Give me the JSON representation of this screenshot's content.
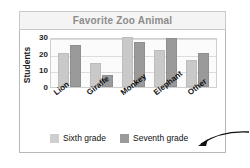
{
  "chart_data": {
    "type": "bar",
    "title": "Favorite Zoo Animal",
    "xlabel": "",
    "ylabel": "Students",
    "ylim": [
      0,
      30
    ],
    "yticks": [
      30,
      20,
      10,
      0
    ],
    "grid": true,
    "legend_position": "bottom",
    "categories": [
      "Lion",
      "Giraffe",
      "Monkey",
      "Elephant",
      "Other"
    ],
    "series": [
      {
        "name": "Sixth grade",
        "color": "#c9c9c9",
        "values": [
          19,
          13,
          29,
          21,
          15
        ]
      },
      {
        "name": "Seventh grade",
        "color": "#9a9a9a",
        "values": [
          24,
          6,
          26,
          28,
          19
        ]
      }
    ]
  },
  "annotation": {
    "arrow_name": "pointer-arrow"
  }
}
